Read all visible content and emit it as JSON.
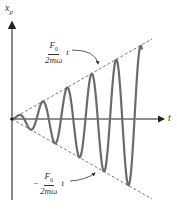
{
  "diagram": {
    "type": "resonance-oscillation",
    "y_axis_label": "x",
    "y_axis_subscript": "p",
    "x_axis_label": "t",
    "upper_envelope": {
      "numerator": "F",
      "numerator_sub": "0",
      "denominator": "2mω",
      "variable": "t",
      "sign": ""
    },
    "lower_envelope": {
      "numerator": "F",
      "numerator_sub": "0",
      "denominator": "2mω",
      "variable": "t",
      "sign": "−"
    },
    "colors": {
      "curve": "#6b6b6b",
      "axis": "#333333",
      "envelope": "#555555",
      "text": "#333333"
    },
    "geometry": {
      "origin_x": 12,
      "origin_y": 119,
      "envelope_slope": 0.57,
      "period_px": 24.5,
      "t_end": 130
    }
  }
}
